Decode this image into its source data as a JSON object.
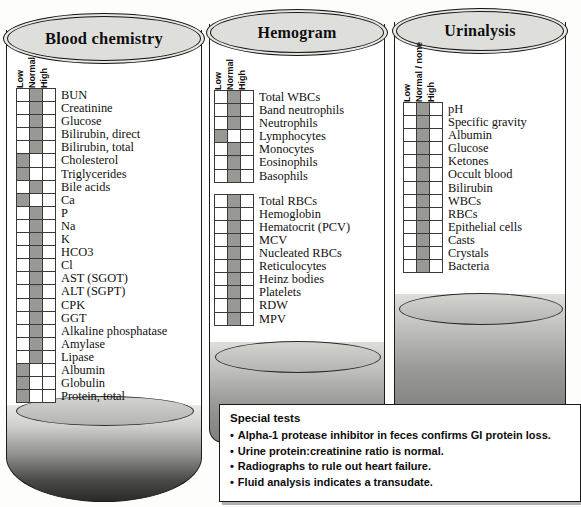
{
  "figure": {
    "columns": [
      "Low",
      "Normal",
      "High"
    ],
    "urinalysis_columns": [
      "Low",
      "Normal / none",
      "High"
    ]
  },
  "tubes": [
    {
      "id": "blood-chemistry",
      "title": "Blood chemistry",
      "headers": [
        "Low",
        "Normal",
        "High"
      ],
      "groups": [
        {
          "rows": [
            {
              "label": "BUN",
              "result": "normal"
            },
            {
              "label": "Creatinine",
              "result": "normal"
            },
            {
              "label": "Glucose",
              "result": "normal"
            },
            {
              "label": "Bilirubin, direct",
              "result": "normal"
            },
            {
              "label": "Bilirubin, total",
              "result": "normal"
            },
            {
              "label": "Cholesterol",
              "result": "low"
            },
            {
              "label": "Triglycerides",
              "result": "low"
            },
            {
              "label": "Bile acids",
              "result": "normal"
            },
            {
              "label": "Ca",
              "result": "low"
            },
            {
              "label": "P",
              "result": "normal"
            },
            {
              "label": "Na",
              "result": "normal"
            },
            {
              "label": "K",
              "result": "normal"
            },
            {
              "label": "HCO3",
              "result": "normal"
            },
            {
              "label": "Cl",
              "result": "normal"
            },
            {
              "label": "AST (SGOT)",
              "result": "normal"
            },
            {
              "label": "ALT (SGPT)",
              "result": "normal"
            },
            {
              "label": "CPK",
              "result": "normal"
            },
            {
              "label": "GGT",
              "result": "normal"
            },
            {
              "label": "Alkaline phosphatase",
              "result": "normal"
            },
            {
              "label": "Amylase",
              "result": "normal"
            },
            {
              "label": "Lipase",
              "result": "normal"
            },
            {
              "label": "Albumin",
              "result": "low"
            },
            {
              "label": "Globulin",
              "result": "low"
            },
            {
              "label": "Protein, total",
              "result": "low"
            }
          ]
        }
      ]
    },
    {
      "id": "hemogram",
      "title": "Hemogram",
      "headers": [
        "Low",
        "Normal",
        "High"
      ],
      "groups": [
        {
          "rows": [
            {
              "label": "Total WBCs",
              "result": "normal"
            },
            {
              "label": "Band neutrophils",
              "result": "normal"
            },
            {
              "label": "Neutrophils",
              "result": "normal"
            },
            {
              "label": "Lymphocytes",
              "result": "low"
            },
            {
              "label": "Monocytes",
              "result": "normal"
            },
            {
              "label": "Eosinophils",
              "result": "normal"
            },
            {
              "label": "Basophils",
              "result": "normal"
            }
          ]
        },
        {
          "rows": [
            {
              "label": "Total RBCs",
              "result": "normal"
            },
            {
              "label": "Hemoglobin",
              "result": "normal"
            },
            {
              "label": "Hematocrit (PCV)",
              "result": "normal"
            },
            {
              "label": "MCV",
              "result": "normal"
            },
            {
              "label": "Nucleated RBCs",
              "result": "normal"
            },
            {
              "label": "Reticulocytes",
              "result": "normal"
            },
            {
              "label": "Heinz bodies",
              "result": "normal"
            },
            {
              "label": "Platelets",
              "result": "normal"
            },
            {
              "label": "RDW",
              "result": "normal"
            },
            {
              "label": "MPV",
              "result": "normal"
            }
          ]
        }
      ]
    },
    {
      "id": "urinalysis",
      "title": "Urinalysis",
      "headers": [
        "Low",
        "Normal / none",
        "High"
      ],
      "groups": [
        {
          "rows": [
            {
              "label": "pH",
              "result": "normal"
            },
            {
              "label": "Specific gravity",
              "result": "normal"
            },
            {
              "label": "Albumin",
              "result": "normal"
            },
            {
              "label": "Glucose",
              "result": "normal"
            },
            {
              "label": "Ketones",
              "result": "normal"
            },
            {
              "label": "Occult blood",
              "result": "normal"
            },
            {
              "label": "Bilirubin",
              "result": "normal"
            },
            {
              "label": "WBCs",
              "result": "normal"
            },
            {
              "label": "RBCs",
              "result": "normal"
            },
            {
              "label": "Epithelial cells",
              "result": "normal"
            },
            {
              "label": "Casts",
              "result": "normal"
            },
            {
              "label": "Crystals",
              "result": "normal"
            },
            {
              "label": "Bacteria",
              "result": "normal"
            }
          ]
        }
      ]
    }
  ],
  "special_tests": {
    "heading": "Special tests",
    "items": [
      "Alpha-1 protease inhibitor in feces confirms GI protein loss.",
      "Urine protein:creatinine ratio is normal.",
      "Radiographs to rule out heart failure.",
      "Fluid analysis indicates a transudate."
    ]
  }
}
